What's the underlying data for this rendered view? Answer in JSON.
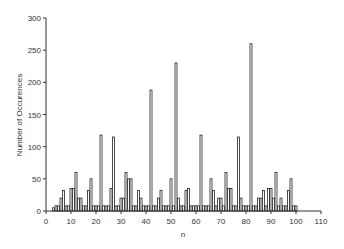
{
  "chart_data": {
    "type": "bar",
    "title": "",
    "xlabel": "n",
    "ylabel": "Number of Occurences",
    "xlim": [
      0,
      110
    ],
    "ylim": [
      0,
      300
    ],
    "xticks": [
      0,
      10,
      20,
      30,
      40,
      50,
      60,
      70,
      80,
      90,
      100,
      110
    ],
    "yticks": [
      0,
      50,
      100,
      150,
      200,
      250,
      300
    ],
    "grid": false,
    "legend": null,
    "categories": [
      3,
      4,
      5,
      6,
      7,
      8,
      9,
      10,
      11,
      12,
      13,
      14,
      15,
      16,
      17,
      18,
      19,
      20,
      21,
      22,
      23,
      24,
      25,
      26,
      27,
      28,
      29,
      30,
      31,
      32,
      33,
      34,
      35,
      36,
      37,
      38,
      39,
      40,
      41,
      42,
      43,
      44,
      45,
      46,
      47,
      48,
      49,
      50,
      51,
      52,
      53,
      54,
      55,
      56,
      57,
      58,
      59,
      60,
      61,
      62,
      63,
      64,
      65,
      66,
      67,
      68,
      69,
      70,
      71,
      72,
      73,
      74,
      75,
      76,
      77,
      78,
      79,
      80,
      81,
      82,
      83,
      84,
      85,
      86,
      87,
      88,
      89,
      90,
      91,
      92,
      93,
      94,
      95,
      96,
      97,
      98,
      99,
      100
    ],
    "values": [
      5,
      8,
      8,
      20,
      32,
      8,
      8,
      35,
      35,
      60,
      20,
      20,
      8,
      8,
      32,
      50,
      8,
      8,
      8,
      118,
      8,
      8,
      8,
      35,
      115,
      8,
      8,
      20,
      20,
      60,
      50,
      50,
      8,
      8,
      32,
      20,
      8,
      8,
      8,
      188,
      8,
      8,
      20,
      32,
      8,
      8,
      8,
      50,
      8,
      230,
      20,
      8,
      8,
      32,
      35,
      8,
      8,
      8,
      8,
      118,
      8,
      8,
      8,
      50,
      32,
      8,
      20,
      20,
      8,
      60,
      35,
      35,
      8,
      8,
      115,
      20,
      8,
      8,
      8,
      260,
      8,
      8,
      20,
      20,
      32,
      8,
      35,
      35,
      20,
      60,
      8,
      20,
      8,
      8,
      32,
      50,
      8,
      8
    ]
  },
  "style": {
    "bar_fill": "#ffffff",
    "bar_stroke": "#222222",
    "axis_color": "#333333"
  }
}
